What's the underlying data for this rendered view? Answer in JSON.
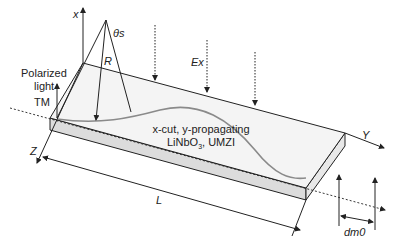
{
  "diagram": {
    "type": "schematic",
    "colors": {
      "line": "#222222",
      "top_face": "#f4f4f4",
      "side_face": "#dcdcdc",
      "mode_curve": "#8a8a8a"
    },
    "labels": {
      "x_axis": "x",
      "theta": "θs",
      "radius": "R",
      "field": "Ex",
      "input_line1": "Polarized",
      "input_line2": "light",
      "mode": "TM",
      "crystal_line1": "x-cut, y-propagating",
      "crystal_line2_main": "LiNbO",
      "crystal_line2_sub": "3",
      "crystal_line2_rest": ", UMZI",
      "y_axis": "Y",
      "z_axis": "Z",
      "length": "L",
      "offset": "dm0"
    }
  }
}
